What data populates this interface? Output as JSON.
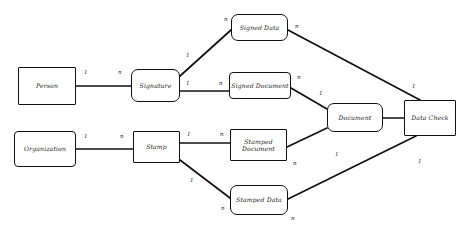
{
  "diagram": {
    "type": "entity-relationship",
    "stroke_color": "#111111",
    "background_color": "#ffffff",
    "nodes": [
      {
        "id": "person",
        "label": "Person",
        "x": 18,
        "y": 67,
        "w": 58,
        "h": 38,
        "shape": "sharp"
      },
      {
        "id": "organization",
        "label": "Organization",
        "x": 14,
        "y": 131,
        "w": 62,
        "h": 36,
        "shape": "soft"
      },
      {
        "id": "signature",
        "label": "Signature",
        "x": 131,
        "y": 69,
        "w": 49,
        "h": 33,
        "shape": "rounded"
      },
      {
        "id": "stamp",
        "label": "Stamp",
        "x": 133,
        "y": 131,
        "w": 47,
        "h": 32,
        "shape": "sharp"
      },
      {
        "id": "signed_data",
        "label": "Signed Data",
        "x": 231,
        "y": 14,
        "w": 57,
        "h": 27,
        "shape": "rounded"
      },
      {
        "id": "signed_document",
        "label": "Signed Document",
        "x": 229,
        "y": 72,
        "w": 62,
        "h": 27,
        "shape": "soft"
      },
      {
        "id": "stamped_document",
        "label": "Stamped Document",
        "x": 230,
        "y": 129,
        "w": 57,
        "h": 32,
        "shape": "sharp"
      },
      {
        "id": "stamped_data",
        "label": "Stamped Data",
        "x": 230,
        "y": 185,
        "w": 58,
        "h": 30,
        "shape": "rounded"
      },
      {
        "id": "document",
        "label": "Document",
        "x": 327,
        "y": 103,
        "w": 56,
        "h": 29,
        "shape": "rounded"
      },
      {
        "id": "data_check",
        "label": "Data Check",
        "x": 404,
        "y": 100,
        "w": 52,
        "h": 36,
        "shape": "sharp"
      }
    ],
    "edges": [
      {
        "id": "person-signature",
        "from": "person",
        "to": "signature",
        "from_card": "1",
        "to_card": "n"
      },
      {
        "id": "organization-stamp",
        "from": "organization",
        "to": "stamp",
        "from_card": "1",
        "to_card": "n"
      },
      {
        "id": "signature-signed-data",
        "from": "signature",
        "to": "signed_data",
        "from_card": "1",
        "to_card": "n"
      },
      {
        "id": "signature-signed-document",
        "from": "signature",
        "to": "signed_document",
        "from_card": "1",
        "to_card": "n"
      },
      {
        "id": "stamp-stamped-document",
        "from": "stamp",
        "to": "stamped_document",
        "from_card": "1",
        "to_card": "n"
      },
      {
        "id": "stamp-stamped-data",
        "from": "stamp",
        "to": "stamped_data",
        "from_card": "1",
        "to_card": "n"
      },
      {
        "id": "signed-document-document",
        "from": "signed_document",
        "to": "document",
        "from_card": "n",
        "to_card": "1"
      },
      {
        "id": "stamped-document-document",
        "from": "stamped_document",
        "to": "document",
        "from_card": "n",
        "to_card": "1"
      },
      {
        "id": "signed-data-data-check",
        "from": "signed_data",
        "to": "data_check",
        "from_card": "n",
        "to_card": "1"
      },
      {
        "id": "stamped-data-data-check",
        "from": "stamped_data",
        "to": "data_check",
        "from_card": "n",
        "to_card": "1"
      },
      {
        "id": "document-data-check",
        "from": "document",
        "to": "data_check",
        "from_card": "1",
        "to_card": "1"
      }
    ],
    "cardinality_labels": [
      {
        "id": "card-person-out",
        "text": "1",
        "x": 84,
        "y": 69
      },
      {
        "id": "card-signature-in",
        "text": "n",
        "x": 118,
        "y": 69
      },
      {
        "id": "card-signature-up-out",
        "text": "1",
        "x": 186,
        "y": 52
      },
      {
        "id": "card-signed-data-in",
        "text": "n",
        "x": 224,
        "y": 16
      },
      {
        "id": "card-signature-right-out",
        "text": "1",
        "x": 186,
        "y": 80
      },
      {
        "id": "card-signed-document-in",
        "text": "n",
        "x": 219,
        "y": 80
      },
      {
        "id": "card-organization-out",
        "text": "1",
        "x": 84,
        "y": 133
      },
      {
        "id": "card-stamp-in",
        "text": "n",
        "x": 120,
        "y": 133
      },
      {
        "id": "card-stamp-right-out",
        "text": "1",
        "x": 187,
        "y": 131
      },
      {
        "id": "card-stamped-document-in",
        "text": "n",
        "x": 220,
        "y": 131
      },
      {
        "id": "card-stamp-down-out",
        "text": "1",
        "x": 190,
        "y": 177
      },
      {
        "id": "card-stamped-data-in",
        "text": "n",
        "x": 221,
        "y": 205
      },
      {
        "id": "card-signed-data-out",
        "text": "n",
        "x": 295,
        "y": 23
      },
      {
        "id": "card-data-check-in-top",
        "text": "1",
        "x": 412,
        "y": 83
      },
      {
        "id": "card-signed-document-out",
        "text": "n",
        "x": 297,
        "y": 74
      },
      {
        "id": "card-document-in-top",
        "text": "1",
        "x": 319,
        "y": 90
      },
      {
        "id": "card-stamped-document-out",
        "text": "n",
        "x": 293,
        "y": 160
      },
      {
        "id": "card-document-in-bottom",
        "text": "1",
        "x": 335,
        "y": 151
      },
      {
        "id": "card-document-out",
        "text": "1",
        "x": 418,
        "y": 158
      },
      {
        "id": "card-stamped-data-out",
        "text": "n",
        "x": 291,
        "y": 215
      }
    ]
  }
}
